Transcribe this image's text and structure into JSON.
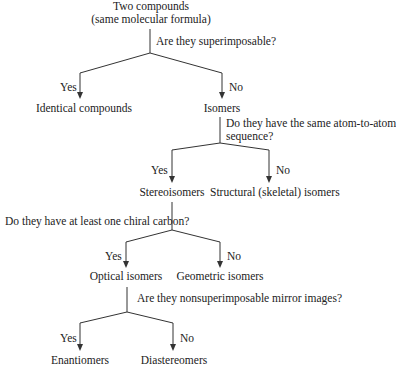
{
  "diagram": {
    "type": "decision-tree",
    "root": {
      "line1": "Two compounds",
      "line2": "(same molecular formula)"
    },
    "questions": {
      "q1": "Are they superimposable?",
      "q2_line1": "Do they have the same atom-to-atom",
      "q2_line2": "sequence?",
      "q3": "Do they have at least one chiral carbon?",
      "q4": "Are they nonsuperimposable mirror images?"
    },
    "branch_labels": {
      "yes": "Yes",
      "no": "No"
    },
    "nodes": {
      "identical": "Identical compounds",
      "isomers": "Isomers",
      "stereoisomers": "Stereoisomers",
      "structural": "Structural (skeletal) isomers",
      "optical": "Optical isomers",
      "geometric": "Geometric isomers",
      "enantiomers": "Enantiomers",
      "diastereomers": "Diastereomers"
    },
    "edges": [
      {
        "from": "Two compounds",
        "question": "Are they superimposable?",
        "yes": "Identical compounds",
        "no": "Isomers"
      },
      {
        "from": "Isomers",
        "question": "Do they have the same atom-to-atom sequence?",
        "yes": "Stereoisomers",
        "no": "Structural (skeletal) isomers"
      },
      {
        "from": "Stereoisomers",
        "question": "Do they have at least one chiral carbon?",
        "yes": "Optical isomers",
        "no": "Geometric isomers"
      },
      {
        "from": "Optical isomers",
        "question": "Are they nonsuperimposable mirror images?",
        "yes": "Enantiomers",
        "no": "Diastereomers"
      }
    ],
    "colors": {
      "line": "#333333",
      "text": "#222222",
      "background": "#ffffff"
    }
  }
}
